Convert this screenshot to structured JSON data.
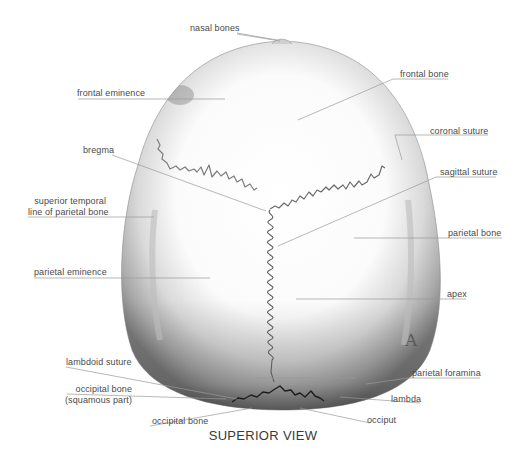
{
  "figure": {
    "caption": "SUPERIOR VIEW",
    "panel_letter": "A"
  },
  "labels": {
    "nasal_bones": "nasal bones",
    "frontal_eminence": "frontal eminence",
    "frontal_bone": "frontal bone",
    "coronal_suture": "coronal suture",
    "bregma": "bregma",
    "sagittal_suture": "sagittal suture",
    "superior_temporal_line_1": "superior temporal",
    "superior_temporal_line_2": "line of parietal bone",
    "parietal_bone": "parietal bone",
    "parietal_eminence": "parietal eminence",
    "apex": "apex",
    "lambdoid_suture": "lambdoid suture",
    "parietal_foramina": "parietal foramina",
    "occipital_bone_squamous_1": "occipital bone",
    "occipital_bone_squamous_2": "(squamous part)",
    "lambda": "lambda",
    "occipital_bone": "occipital bone",
    "occiput": "occiput"
  },
  "colors": {
    "background": "#ffffff",
    "label_text": "#4a4a4a",
    "leader_line": "#9a9a9a",
    "bone_light": "#ffffff",
    "bone_shadow": "#6f6f6f",
    "suture": "#555555"
  }
}
